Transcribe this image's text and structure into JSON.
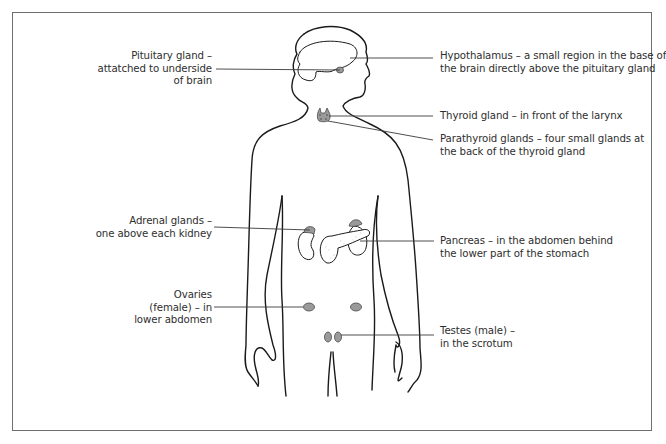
{
  "diagram": {
    "type": "labelled anatomical illustration",
    "colors": {
      "outline": "#1a1a1a",
      "gland_fill": "#9a9a9a",
      "pancreas_fill": "#ffffff",
      "frame": "#6e6e6e",
      "text": "#2e2e2e"
    }
  },
  "labels": {
    "pituitary": {
      "lines": [
        "Pituitary gland –",
        "attatched to underside",
        "of brain"
      ]
    },
    "hypothalamus": {
      "lines": [
        "Hypothalamus – a small region in the base of",
        "the brain directly above the pituitary gland"
      ]
    },
    "thyroid": {
      "lines": [
        "Thyroid gland – in front of the larynx"
      ]
    },
    "parathyroid": {
      "lines": [
        "Parathyroid glands – four small glands at",
        "the back of the thyroid gland"
      ]
    },
    "adrenal": {
      "lines": [
        "Adrenal glands –",
        "one above each kidney"
      ]
    },
    "pancreas": {
      "lines": [
        "Pancreas – in the abdomen behind",
        "the lower part of the stomach"
      ]
    },
    "ovaries": {
      "lines": [
        "Ovaries",
        "(female) – in",
        "lower abdomen"
      ]
    },
    "testes": {
      "lines": [
        "Testes (male) –",
        "in the scrotum"
      ]
    }
  }
}
